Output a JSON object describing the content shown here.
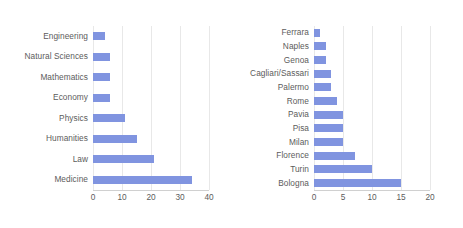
{
  "figure": {
    "background_color": "#ffffff",
    "bar_color": "#8094e0",
    "text_color": "#5c5c5c",
    "gridline_color": "#e8e8e8"
  },
  "chart_data": [
    {
      "type": "bar",
      "orientation": "horizontal",
      "panel": "left",
      "title": "",
      "xlabel": "",
      "ylabel": "",
      "categories": [
        "Engineering",
        "Natural Sciences",
        "Mathematics",
        "Economy",
        "Physics",
        "Humanities",
        "Law",
        "Medicine"
      ],
      "values": [
        4,
        6,
        6,
        6,
        11,
        15,
        21,
        34
      ],
      "xlim": [
        0,
        40
      ],
      "xticks": [
        0,
        10,
        20,
        30,
        40
      ],
      "xtick_labels": [
        "0",
        "10",
        "20",
        "30",
        "40"
      ],
      "grid": true,
      "legend": false
    },
    {
      "type": "bar",
      "orientation": "horizontal",
      "panel": "right",
      "title": "",
      "xlabel": "",
      "ylabel": "",
      "categories": [
        "Ferrara",
        "Naples",
        "Genoa",
        "Cagliari/Sassari",
        "Palermo",
        "Rome",
        "Pavia",
        "Pisa",
        "Milan",
        "Florence",
        "Turin",
        "Bologna"
      ],
      "values": [
        1,
        2,
        2,
        3,
        3,
        4,
        5,
        5,
        5,
        7,
        10,
        15
      ],
      "xlim": [
        0,
        20
      ],
      "xticks": [
        0,
        5,
        10,
        15,
        20
      ],
      "xtick_labels": [
        "0",
        "5",
        "10",
        "15",
        "20"
      ],
      "grid": true,
      "legend": false
    }
  ]
}
